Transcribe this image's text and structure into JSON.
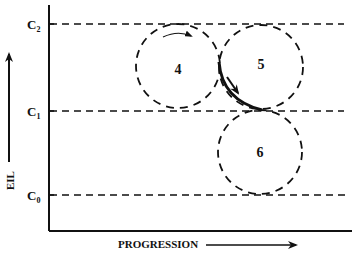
{
  "diagram": {
    "y_axis": {
      "label": "EIL"
    },
    "x_axis": {
      "label": "PROGRESSION"
    },
    "levels": [
      {
        "name": "C2",
        "main": "C",
        "sub": "2",
        "y": 24
      },
      {
        "name": "C1",
        "main": "C",
        "sub": "1",
        "y": 111
      },
      {
        "name": "C0",
        "main": "C",
        "sub": "0",
        "y": 195
      }
    ],
    "circles": [
      {
        "label": "4",
        "cx": 178,
        "cy": 66,
        "r": 42
      },
      {
        "label": "5",
        "cx": 261,
        "cy": 67,
        "r": 42
      },
      {
        "label": "6",
        "cx": 260,
        "cy": 152,
        "r": 42
      }
    ],
    "colors": {
      "ink": "#111111",
      "background": "#ffffff"
    }
  }
}
